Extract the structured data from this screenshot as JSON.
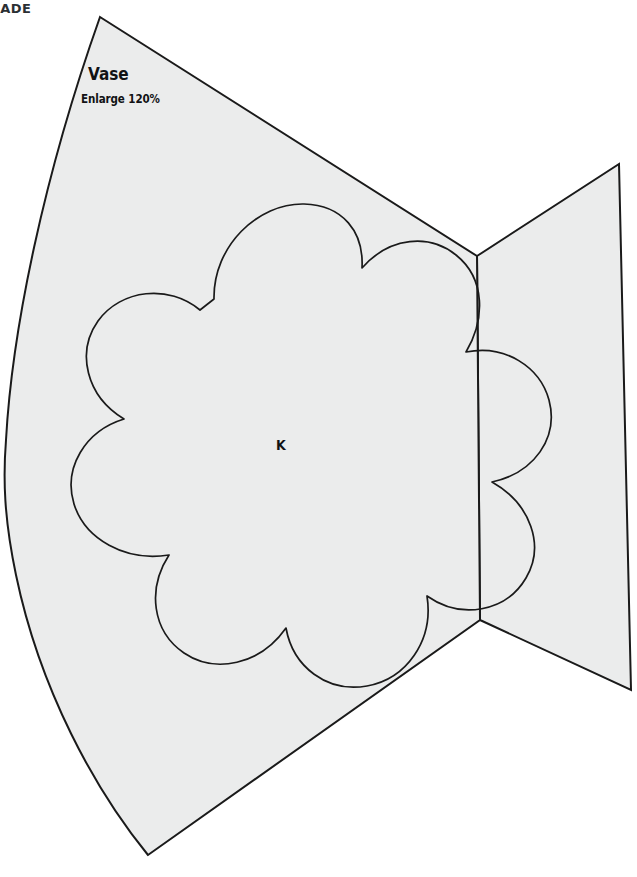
{
  "page": {
    "background_color": "#ffffff",
    "width": 637,
    "height": 877
  },
  "header": {
    "partial_text": "EADE"
  },
  "pattern": {
    "fill_color": "#ebecec",
    "stroke_color": "#1a1a1a",
    "piece_label": "Vase",
    "piece_note": "Enlarge 120%",
    "inner_piece_label": "K",
    "outer_shape_name": "vase-fan-body",
    "tail_shape_name": "vase-tail",
    "inner_shape_name": "flower-applique-outline"
  },
  "geometry": {
    "fan": {
      "apex": [
        100,
        17
      ],
      "top_notch_vertex": [
        477,
        256
      ],
      "bottom_notch_vertex": [
        480,
        620
      ],
      "bottom_left_vertex": [
        148,
        855
      ],
      "leftmost_bulge_x": 6
    },
    "tail": {
      "top_right": [
        619,
        164
      ],
      "bottom_right": [
        631,
        690
      ]
    },
    "flower": {
      "center": [
        283,
        447
      ],
      "lobe_count": 8,
      "top_extent_y": 200,
      "bottom_extent_y": 696,
      "left_extent_x": 22,
      "right_extent_x": 551
    }
  }
}
